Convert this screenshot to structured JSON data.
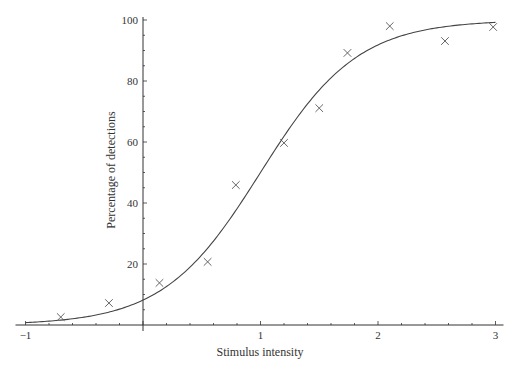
{
  "chart_data": {
    "type": "scatter",
    "title": "",
    "xlabel": "Stimulus intensity",
    "ylabel": "Percentage of detections",
    "xlim": [
      -1,
      3
    ],
    "ylim": [
      0,
      100
    ],
    "grid": false,
    "legend": null,
    "x_ticks": [
      -1,
      1,
      2,
      3
    ],
    "x_tick_labels": [
      "−1",
      "1",
      "2",
      "3"
    ],
    "x_minor_step": 0.2,
    "y_ticks": [
      20,
      40,
      60,
      80,
      100
    ],
    "y_tick_labels": [
      "20",
      "40",
      "60",
      "80",
      "100"
    ],
    "y_minor_step": 5,
    "series": [
      {
        "name": "Observed detections",
        "type": "scatter",
        "marker": "x",
        "x": [
          -0.7,
          -0.29,
          0.14,
          0.55,
          0.79,
          1.2,
          1.5,
          1.74,
          2.1,
          2.57,
          2.98
        ],
        "y": [
          2.6,
          7.2,
          13.8,
          20.7,
          45.9,
          59.7,
          71.1,
          89.2,
          98.0,
          93.1,
          97.7
        ]
      },
      {
        "name": "Fitted psychometric curve",
        "type": "line",
        "model": "logistic",
        "center": 1.0,
        "slope": 2.42,
        "x": [
          -1,
          -0.5,
          0,
          0.5,
          1,
          1.5,
          2,
          2.5,
          3
        ],
        "y": [
          0.8,
          2.6,
          8.2,
          23.0,
          50.0,
          77.0,
          91.8,
          97.4,
          99.2
        ]
      }
    ],
    "colors": {
      "axis": "#333333",
      "curve": "#444444",
      "markers": "#555555"
    }
  }
}
